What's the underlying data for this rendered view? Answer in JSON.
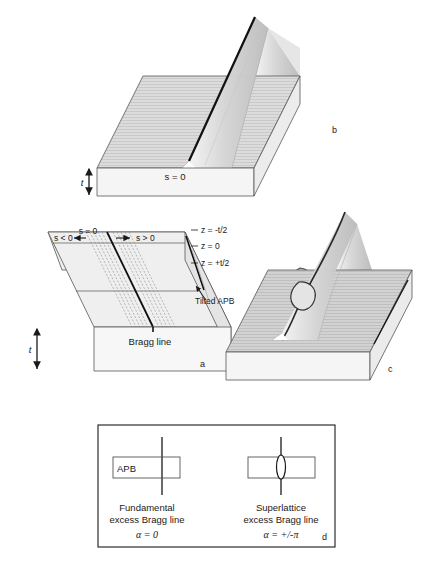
{
  "figure": {
    "background_color": "#ffffff",
    "line_color": "#1a1a1a",
    "slab_top_color": "#d9d9d9",
    "slab_front_color": "#f2f2f2",
    "slab_side_color": "#e8e8e8",
    "surface_color": "#cccccc"
  },
  "panel_a": {
    "label": "a",
    "s_negative": "s < 0",
    "s_zero": "s = 0",
    "s_positive": "s > 0",
    "z_top": "z = -t/2",
    "z_mid": "z = 0",
    "z_bottom": "z = +t/2",
    "tilted_apb": "Tilted APB",
    "bragg_line": "Bragg line",
    "thickness": "t"
  },
  "panel_b": {
    "label": "b",
    "s_zero": "s = 0",
    "thickness": "t"
  },
  "panel_c": {
    "label": "c"
  },
  "panel_d": {
    "label": "d",
    "apb_label": "APB",
    "left_caption_line1": "Fundamental",
    "left_caption_line2": "excess Bragg line",
    "left_alpha": "α = 0",
    "right_caption_line1": "Superlattice",
    "right_caption_line2": "excess Bragg line",
    "right_alpha": "α = +/-π"
  }
}
